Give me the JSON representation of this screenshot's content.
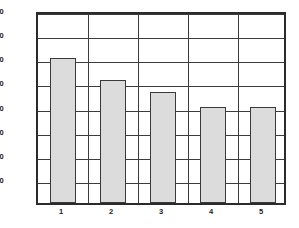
{
  "chart_data": {
    "type": "bar",
    "title": "",
    "subtitle": "",
    "xlabel": "",
    "ylabel": "",
    "categories": [
      "1",
      "2",
      "3",
      "4",
      "5"
    ],
    "values": [
      180,
      153,
      138,
      120,
      120
    ],
    "series": [
      {
        "name": "",
        "values": [
          180,
          153,
          138,
          120,
          120
        ]
      }
    ],
    "ylim": [
      0,
      240
    ],
    "xlim": [
      0,
      5
    ],
    "yticks": [
      30,
      60,
      90,
      120,
      150,
      180,
      210,
      240
    ],
    "ytick_labels": [
      "30",
      "60",
      "90",
      "120",
      "150",
      "180",
      "210",
      "240"
    ],
    "xticks": [
      1,
      2,
      3,
      4,
      5
    ],
    "xtick_labels": [
      "1",
      "2",
      "3",
      "4",
      "5"
    ],
    "grid": {
      "horizontal": true,
      "vertical": true
    },
    "legend": {
      "visible": false,
      "position": "none",
      "entries": []
    },
    "annotations": [],
    "colors": {
      "bar_fill": "#dcdcdc",
      "bar_edge": "#3a3a3a",
      "grid": "#3c3c3c",
      "axis": "#2b2b2b",
      "background": "#ffffff",
      "text": "#1a1a1a"
    }
  }
}
